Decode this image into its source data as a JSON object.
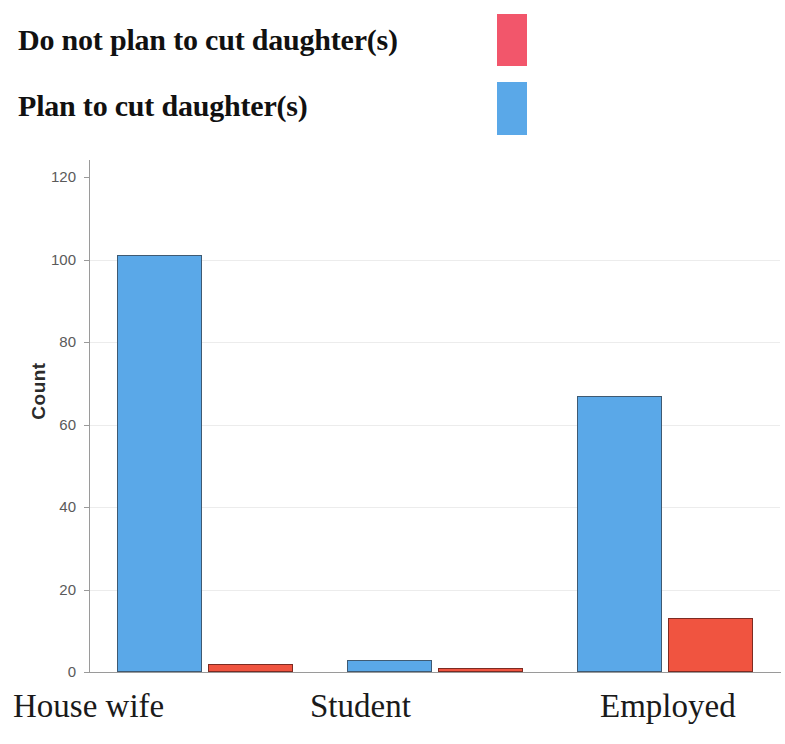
{
  "chart_data": {
    "type": "bar",
    "title": "",
    "subtitle": "",
    "xlabel": "",
    "ylabel": "Count",
    "categories": [
      "House wife",
      "Student",
      "Employed"
    ],
    "series": [
      {
        "name": "Plan to cut daughter(s)",
        "color": "#5aa8e8",
        "border_color": "#3f5a72",
        "values": [
          101,
          3,
          67
        ]
      },
      {
        "name": "Do not plan to cut daughter(s)",
        "color": "#f05440",
        "border_color": "#7d2b22",
        "values": [
          2,
          1,
          13
        ]
      }
    ],
    "ylim": [
      0,
      120
    ],
    "yticks": [
      0,
      20,
      40,
      60,
      80,
      100,
      120
    ],
    "ytick_labels": [
      "0",
      "20",
      "40",
      "60",
      "80",
      "100",
      "120"
    ],
    "grid": true,
    "grid_axis": "y",
    "legend_position": "top-left",
    "legend_entries": [
      {
        "label": "Do not plan to cut daughter(s)",
        "color": "#f2566b"
      },
      {
        "label": "Plan to cut daughter(s)",
        "color": "#5aa8e8"
      }
    ]
  }
}
